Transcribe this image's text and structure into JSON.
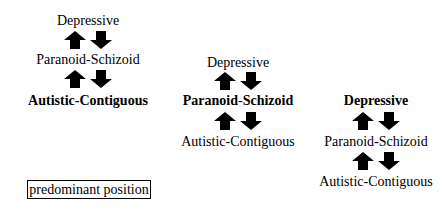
{
  "diagram": {
    "columns": [
      {
        "predominant": "Autistic-Contiguous",
        "levels": [
          {
            "label": "Depressive",
            "bold": false
          },
          {
            "label": "Paranoid-Schizoid",
            "bold": false
          },
          {
            "label": "Autistic-Contiguous",
            "bold": true
          }
        ]
      },
      {
        "predominant": "Paranoid-Schizoid",
        "levels": [
          {
            "label": "Depressive",
            "bold": false
          },
          {
            "label": "Paranoid-Schizoid",
            "bold": true
          },
          {
            "label": "Autistic-Contiguous",
            "bold": false
          }
        ]
      },
      {
        "predominant": "Depressive",
        "levels": [
          {
            "label": "Depressive",
            "bold": true
          },
          {
            "label": "Paranoid-Schizoid",
            "bold": false
          },
          {
            "label": "Autistic-Contiguous",
            "bold": false
          }
        ]
      }
    ],
    "arrows": {
      "up": "arrow-up-icon",
      "down": "arrow-down-icon"
    },
    "legend": {
      "label": "predominant position"
    }
  }
}
